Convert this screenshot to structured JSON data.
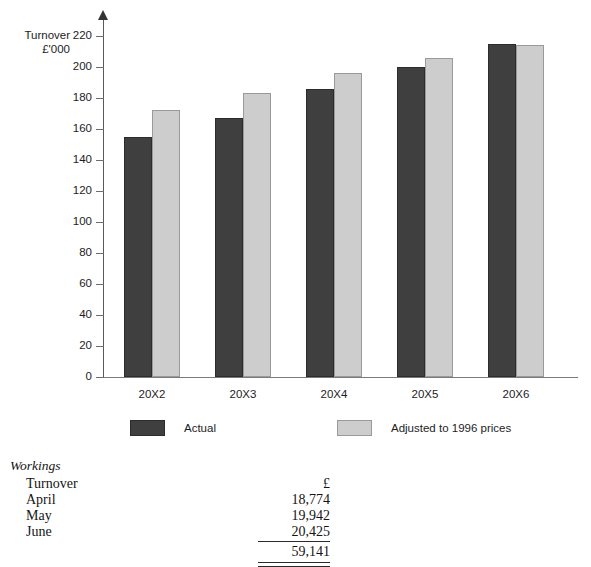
{
  "chart_data": {
    "type": "bar",
    "title": "",
    "xlabel": "",
    "ylabel": "Turnover £'000",
    "ylabel_lines": [
      "Turnover",
      "£'000"
    ],
    "categories": [
      "20X2",
      "20X3",
      "20X4",
      "20X5",
      "20X6"
    ],
    "series": [
      {
        "name": "Actual",
        "color": "#3f3f3f",
        "values": [
          155,
          167,
          186,
          200,
          215
        ]
      },
      {
        "name": "Adjusted to 1996 prices",
        "color": "#cdcdcd",
        "values": [
          172,
          183,
          196,
          206,
          214
        ]
      }
    ],
    "ylim": [
      0,
      220
    ],
    "yticks": [
      0,
      20,
      40,
      60,
      80,
      100,
      120,
      140,
      160,
      180,
      200,
      220
    ],
    "ytick_labels": [
      "0",
      "20",
      "40",
      "60",
      "80",
      "100",
      "120",
      "140",
      "160",
      "180",
      "200",
      "220"
    ],
    "grid": false,
    "legend_position": "bottom"
  },
  "legend": {
    "items": [
      {
        "label": "Actual",
        "swatch": "actual"
      },
      {
        "label": "Adjusted to 1996 prices",
        "swatch": "adjusted"
      }
    ]
  },
  "workings": {
    "heading": "Workings",
    "rows": [
      {
        "label": "Turnover",
        "value": "£"
      },
      {
        "label": "April",
        "value": "18,774"
      },
      {
        "label": "May",
        "value": "19,942"
      },
      {
        "label": "June",
        "value": "20,425"
      }
    ],
    "total": "59,141"
  }
}
